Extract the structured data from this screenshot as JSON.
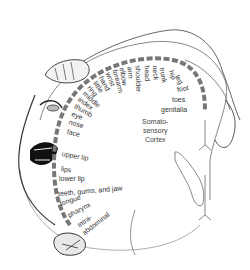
{
  "diagram": {
    "cortex_label": [
      "Somato-",
      "sensory",
      "Cortex"
    ],
    "colors": {
      "band": "#777777",
      "outline": "#555555",
      "text": "#333333",
      "background": "#ffffff"
    },
    "body_parts": [
      {
        "label": "genitalia",
        "x": 161,
        "y": 106,
        "angle": 0
      },
      {
        "label": "toes",
        "x": 172,
        "y": 96,
        "angle": 0
      },
      {
        "label": "foot",
        "x": 177,
        "y": 86,
        "angle": -10
      },
      {
        "label": "leg",
        "x": 177,
        "y": 72,
        "angle": 60
      },
      {
        "label": "hip",
        "x": 171,
        "y": 67,
        "angle": 70
      },
      {
        "label": "trunk",
        "x": 162,
        "y": 64,
        "angle": 80
      },
      {
        "label": "neck",
        "x": 155,
        "y": 62,
        "angle": 85
      },
      {
        "label": "head",
        "x": 147,
        "y": 62,
        "angle": 88
      },
      {
        "label": "shoulder",
        "x": 138,
        "y": 62,
        "angle": 88
      },
      {
        "label": "arm",
        "x": 130,
        "y": 63,
        "angle": 85
      },
      {
        "label": "elbow",
        "x": 122,
        "y": 64,
        "angle": 80
      },
      {
        "label": "forearm",
        "x": 115,
        "y": 66,
        "angle": 75
      },
      {
        "label": "wrist",
        "x": 108,
        "y": 69,
        "angle": 68
      },
      {
        "label": "hand",
        "x": 101,
        "y": 73,
        "angle": 62
      },
      {
        "label": "little",
        "x": 95,
        "y": 78,
        "angle": 55
      },
      {
        "label": "ring",
        "x": 89,
        "y": 83,
        "angle": 50
      },
      {
        "label": "middle",
        "x": 84,
        "y": 89,
        "angle": 42
      },
      {
        "label": "index",
        "x": 79,
        "y": 95,
        "angle": 36
      },
      {
        "label": "thumb",
        "x": 75,
        "y": 102,
        "angle": 30
      },
      {
        "label": "eye",
        "x": 72,
        "y": 110,
        "angle": 22
      },
      {
        "label": "nose",
        "x": 69,
        "y": 118,
        "angle": 18
      },
      {
        "label": "face",
        "x": 67,
        "y": 128,
        "angle": 12
      },
      {
        "label": "upper lip",
        "x": 62,
        "y": 150,
        "angle": 10
      },
      {
        "label": "lips",
        "x": 61,
        "y": 165,
        "angle": 8
      },
      {
        "label": "lower lip",
        "x": 59,
        "y": 175,
        "angle": 0
      },
      {
        "label": "teeth, gums, and jaw",
        "x": 58,
        "y": 190,
        "angle": -5
      },
      {
        "label": "tongue",
        "x": 60,
        "y": 200,
        "angle": -18
      },
      {
        "label": "pharynx",
        "x": 68,
        "y": 212,
        "angle": -28
      },
      {
        "label": "intra-",
        "x": 78,
        "y": 222,
        "angle": -35
      },
      {
        "label": "abdominal",
        "x": 83,
        "y": 230,
        "angle": -38
      }
    ]
  }
}
